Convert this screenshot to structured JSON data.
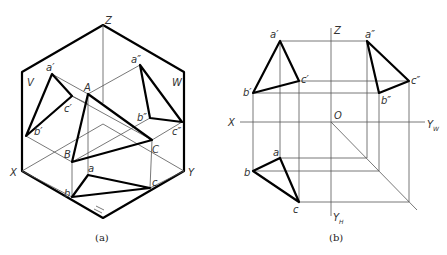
{
  "figure_a": {
    "caption": "(a)",
    "labels": {
      "Z": "Z",
      "V": "V",
      "W": "W",
      "X": "X",
      "Y": "Y",
      "H": "H",
      "A": "A",
      "B": "B",
      "C": "C",
      "a_v": "a′",
      "b_v": "b′",
      "c_v": "c′",
      "a_w": "a″",
      "b_w": "b″",
      "c_w": "c″",
      "a_h": "a",
      "b_h": "b",
      "c_h": "c"
    }
  },
  "figure_b": {
    "caption": "(b)",
    "labels": {
      "Z": "Z",
      "X": "X",
      "O": "O",
      "Yw": "Y",
      "Yw_sub": "W",
      "Yh": "Y",
      "Yh_sub": "H",
      "a_v": "a′",
      "b_v": "b′",
      "c_v": "c′",
      "a_w": "a″",
      "b_w": "b″",
      "c_w": "c″",
      "a_h": "a",
      "b_h": "b",
      "c_h": "c"
    }
  }
}
